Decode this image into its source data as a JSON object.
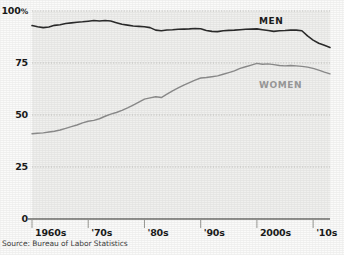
{
  "chart_data": {
    "type": "line",
    "title": "",
    "subtitle": "",
    "xlabel": "",
    "ylabel": "",
    "source": "Source: Bureau of Labor Statistics",
    "grid": true,
    "legend_position": "inline-right",
    "xlim": [
      1960,
      2013
    ],
    "ylim": [
      0,
      100
    ],
    "yticks": [
      {
        "value": 0,
        "label": "0"
      },
      {
        "value": 25,
        "label": "25"
      },
      {
        "value": 50,
        "label": "50"
      },
      {
        "value": 75,
        "label": "75"
      },
      {
        "value": 100,
        "label": "100",
        "suffix": "%"
      }
    ],
    "xticks": [
      {
        "value": 1960,
        "label": "1960s"
      },
      {
        "value": 1970,
        "label": "'70s"
      },
      {
        "value": 1980,
        "label": "'80s"
      },
      {
        "value": 1990,
        "label": "'90s"
      },
      {
        "value": 2000,
        "label": "2000s"
      },
      {
        "value": 2010,
        "label": "'10s"
      }
    ],
    "series": [
      {
        "name": "MEN",
        "label": "MEN",
        "color": "#2b2b2b",
        "x": [
          1960,
          1961,
          1962,
          1963,
          1964,
          1965,
          1966,
          1967,
          1968,
          1969,
          1970,
          1971,
          1972,
          1973,
          1974,
          1975,
          1976,
          1977,
          1978,
          1979,
          1980,
          1981,
          1982,
          1983,
          1984,
          1985,
          1986,
          1987,
          1988,
          1989,
          1990,
          1991,
          1992,
          1993,
          1994,
          1995,
          1996,
          1997,
          1998,
          1999,
          2000,
          2001,
          2002,
          2003,
          2004,
          2005,
          2006,
          2007,
          2008,
          2009,
          2010,
          2011,
          2012,
          2013
        ],
        "values": [
          93.0,
          92.4,
          92.0,
          92.3,
          93.1,
          93.4,
          94.0,
          94.3,
          94.6,
          94.8,
          95.1,
          95.4,
          95.2,
          95.4,
          95.2,
          94.4,
          93.6,
          93.2,
          92.8,
          92.6,
          92.4,
          92.0,
          90.8,
          90.5,
          90.9,
          91.0,
          91.2,
          91.3,
          91.4,
          91.6,
          91.5,
          90.6,
          90.2,
          90.1,
          90.5,
          90.7,
          90.8,
          91.0,
          91.2,
          91.3,
          91.4,
          91.0,
          90.6,
          90.2,
          90.5,
          90.6,
          90.8,
          90.8,
          90.5,
          88.0,
          86.0,
          84.5,
          83.5,
          82.5
        ],
        "linewidth": 1.6
      },
      {
        "name": "WOMEN",
        "label": "WOMEN",
        "color": "#8c8c8c",
        "x": [
          1960,
          1961,
          1962,
          1963,
          1964,
          1965,
          1966,
          1967,
          1968,
          1969,
          1970,
          1971,
          1972,
          1973,
          1974,
          1975,
          1976,
          1977,
          1978,
          1979,
          1980,
          1981,
          1982,
          1983,
          1984,
          1985,
          1986,
          1987,
          1988,
          1989,
          1990,
          1991,
          1992,
          1993,
          1994,
          1995,
          1996,
          1997,
          1998,
          1999,
          2000,
          2001,
          2002,
          2003,
          2004,
          2005,
          2006,
          2007,
          2008,
          2009,
          2010,
          2011,
          2012,
          2013
        ],
        "values": [
          41.0,
          41.2,
          41.4,
          41.8,
          42.2,
          42.8,
          43.6,
          44.4,
          45.2,
          46.2,
          47.0,
          47.4,
          48.2,
          49.4,
          50.4,
          51.2,
          52.2,
          53.4,
          54.8,
          56.2,
          57.6,
          58.2,
          58.8,
          58.4,
          60.0,
          61.6,
          63.0,
          64.4,
          65.6,
          66.8,
          67.8,
          68.0,
          68.4,
          68.8,
          69.6,
          70.4,
          71.2,
          72.4,
          73.2,
          74.0,
          74.8,
          74.4,
          74.6,
          74.2,
          73.8,
          73.6,
          73.8,
          73.6,
          73.4,
          73.0,
          72.4,
          71.6,
          70.6,
          69.8
        ],
        "linewidth": 1.4
      }
    ]
  },
  "axes": {
    "yaxis_name": "y-axis",
    "xaxis_name": "x-axis",
    "baseline_name": "x-axis-baseline"
  }
}
